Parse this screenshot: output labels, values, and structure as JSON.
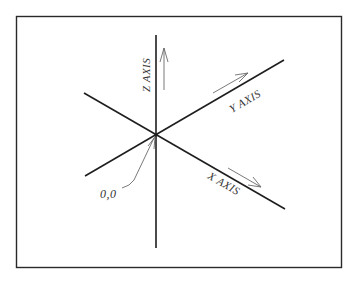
{
  "diagram": {
    "labels": {
      "z_axis": "Z AXIS",
      "y_axis": "Y AXIS",
      "x_axis": "X AXIS",
      "origin": "0,0"
    },
    "colors": {
      "axis": "#1e1e1e",
      "arrow": "#6a6a6a",
      "frame": "#2a2a2a",
      "text": "#333333",
      "background": "#ffffff"
    }
  }
}
